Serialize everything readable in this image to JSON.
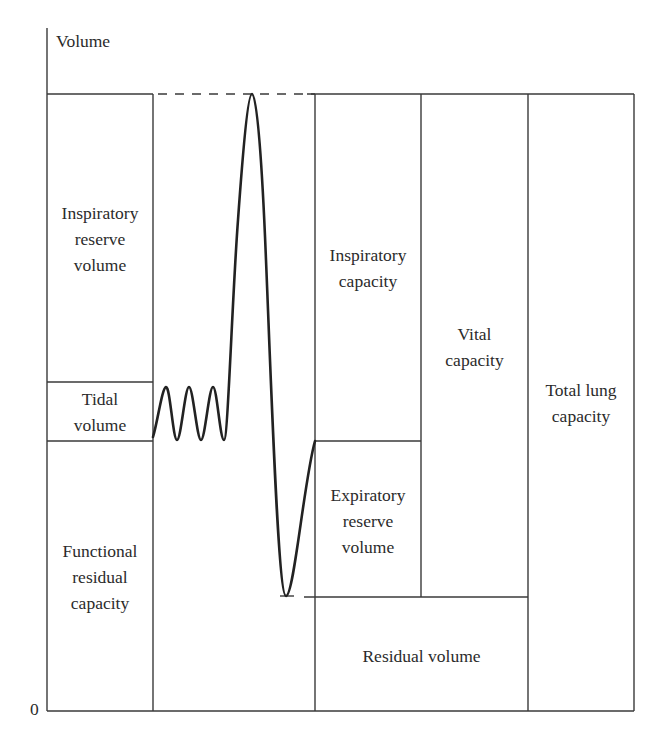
{
  "diagram": {
    "y_axis_label": "Volume",
    "origin_label": "0",
    "line_color": "#3a3a3a",
    "curve_color": "#222222",
    "left_column": {
      "inspiratory_reserve_volume": "Inspiratory reserve volume",
      "irv_lines": [
        "Inspiratory",
        "reserve",
        "volume"
      ],
      "tidal_volume_lines": [
        "Tidal",
        "volume"
      ],
      "frc_lines": [
        "Functional",
        "residual",
        "capacity"
      ]
    },
    "right_columns": {
      "inspiratory_capacity_lines": [
        "Inspiratory",
        "capacity"
      ],
      "expiratory_reserve_volume_lines": [
        "Expiratory",
        "reserve",
        "volume"
      ],
      "residual_volume": "Residual volume",
      "vital_capacity_lines": [
        "Vital",
        "capacity"
      ],
      "total_lung_capacity_lines": [
        "Total lung",
        "capacity"
      ]
    }
  }
}
